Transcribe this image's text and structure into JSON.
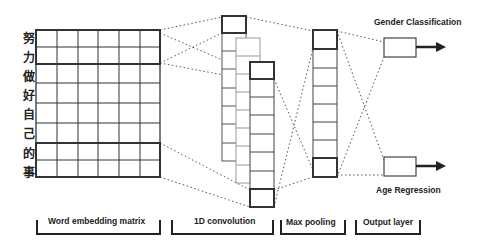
{
  "matrix": {
    "tokens": [
      "努",
      "力",
      "做",
      "好",
      "自",
      "己",
      "的",
      "事"
    ],
    "columns": 6,
    "rows": 8
  },
  "stages": {
    "word_embedding": "Word embedding matrix",
    "conv": "1D convolution",
    "pooling": "Max pooling",
    "output": "Output layer"
  },
  "outputs": {
    "gender": "Gender Classification",
    "age": "Age Regression"
  },
  "colors": {
    "line": "#333333",
    "light_line": "#888888",
    "dotted": "#555555"
  }
}
